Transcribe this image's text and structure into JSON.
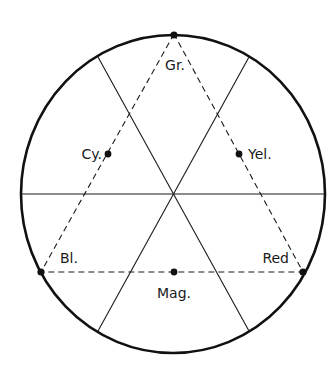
{
  "diagram": {
    "title": "",
    "colors": {
      "stroke": "#111111",
      "background": "#ffffff"
    },
    "labels": {
      "green": "Gr.",
      "cyan": "Cy.",
      "yellow": "Yel.",
      "blue": "Bl.",
      "red": "Red",
      "magenta": "Mag."
    },
    "nodes": [
      {
        "id": "green",
        "label": "Gr.",
        "x": 174,
        "y": 34,
        "type": "vertex"
      },
      {
        "id": "blue",
        "label": "Bl.",
        "x": 41,
        "y": 272,
        "type": "vertex"
      },
      {
        "id": "red",
        "label": "Red",
        "x": 303,
        "y": 272,
        "type": "vertex"
      },
      {
        "id": "cyan",
        "label": "Cy.",
        "x": 108,
        "y": 154,
        "type": "midpoint"
      },
      {
        "id": "yellow",
        "label": "Yel.",
        "x": 239,
        "y": 154,
        "type": "midpoint"
      },
      {
        "id": "magenta",
        "label": "Mag.",
        "x": 174,
        "y": 272,
        "type": "midpoint"
      }
    ],
    "edges": [
      {
        "from": "green",
        "to": "blue",
        "style": "dashed"
      },
      {
        "from": "blue",
        "to": "red",
        "style": "dashed"
      },
      {
        "from": "red",
        "to": "green",
        "style": "dashed"
      }
    ]
  }
}
